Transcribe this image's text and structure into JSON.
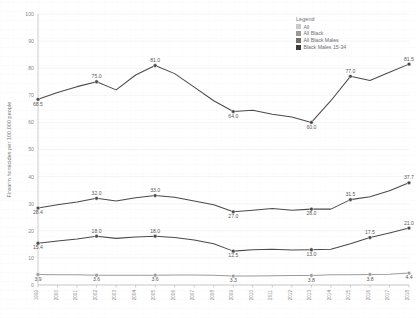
{
  "legend": {
    "title": "Legend",
    "entries": [
      {
        "label": "All",
        "color": "#c9c9c9"
      },
      {
        "label": "All Black",
        "color": "#9a9a9a"
      },
      {
        "label": "All Black Males",
        "color": "#6e6e6e"
      },
      {
        "label": "Black Males 15-34",
        "color": "#3c3c3c"
      }
    ]
  },
  "chart_data": {
    "type": "line",
    "title": "",
    "xlabel": "",
    "ylabel": "Firearm homicides per 100,000 people",
    "ylim": [
      0,
      100
    ],
    "yticks": [
      0,
      10,
      20,
      30,
      40,
      50,
      60,
      70,
      80,
      90,
      100
    ],
    "grid": true,
    "legend_position": "top-right",
    "categories": [
      "1999",
      "2000",
      "2001",
      "2002",
      "2003",
      "2004",
      "2005",
      "2006",
      "2007",
      "2008",
      "2009",
      "2010",
      "2011",
      "2012",
      "2013",
      "2014",
      "2015",
      "2016",
      "2017",
      "2018"
    ],
    "series": [
      {
        "name": "Black Males 15-34",
        "color": "#4a4a4a",
        "values": [
          68.5,
          71.0,
          73.2,
          75.0,
          72.0,
          77.5,
          81.0,
          78.0,
          73.0,
          68.0,
          64.0,
          64.5,
          63.0,
          62.0,
          60.0,
          68.0,
          77.0,
          75.5,
          78.5,
          81.5
        ],
        "labels": {
          "0": "68.5",
          "3": "75.0",
          "6": "81.0",
          "10": "64.0",
          "14": "60.0",
          "16": "77.0",
          "19": "81.5"
        }
      },
      {
        "name": "All Black Males",
        "color": "#4a4a4a",
        "values": [
          28.4,
          29.6,
          30.6,
          32.0,
          31.0,
          32.2,
          33.0,
          32.4,
          31.0,
          29.6,
          27.0,
          27.6,
          28.2,
          27.6,
          28.0,
          28.0,
          31.5,
          32.6,
          34.8,
          37.7
        ],
        "labels": {
          "0": "28.4",
          "3": "32.0",
          "6": "33.0",
          "10": "27.0",
          "14": "28.0",
          "16": "31.5",
          "19": "37.7"
        }
      },
      {
        "name": "All Black",
        "color": "#4a4a4a",
        "values": [
          15.4,
          16.2,
          17.0,
          18.0,
          17.2,
          17.7,
          18.0,
          17.5,
          16.6,
          15.2,
          12.5,
          13.0,
          13.2,
          12.9,
          13.0,
          13.2,
          15.2,
          17.5,
          19.2,
          21.0
        ],
        "labels": {
          "0": "15.4",
          "3": "18.0",
          "6": "18.0",
          "10": "12.5",
          "14": "13.0",
          "17": "17.5",
          "19": "21.0"
        }
      },
      {
        "name": "All",
        "color": "#9b9b9b",
        "values": [
          3.9,
          3.8,
          3.8,
          3.6,
          3.6,
          3.6,
          3.6,
          3.7,
          3.7,
          3.6,
          3.3,
          3.3,
          3.4,
          3.5,
          3.5,
          3.8,
          3.8,
          3.9,
          4.0,
          4.4
        ],
        "labels": {
          "0": "3.9",
          "3": "3.6",
          "6": "3.6",
          "10": "3.3",
          "14": "3.8",
          "17": "3.8",
          "19": "4.4"
        }
      }
    ]
  }
}
